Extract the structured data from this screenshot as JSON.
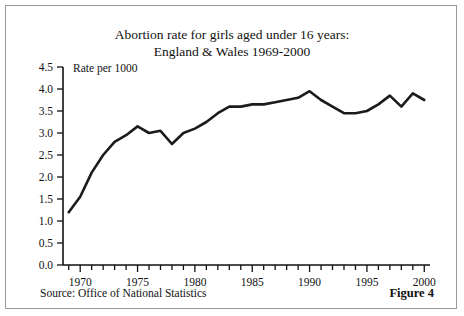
{
  "figure": {
    "source_note": "Source: Office of National Statistics",
    "figure_label": "Figure 4"
  },
  "chart_data": {
    "type": "line",
    "title": "Abortion rate for girls aged under 16 years:",
    "subtitle": "England & Wales 1969-2000",
    "title_line1": "Abortion rate for girls aged under 16 years:",
    "title_line2": "England & Wales 1969-2000",
    "xlabel": "",
    "ylabel": "",
    "axis_note": "Rate per 1000",
    "grid": false,
    "legend": "none",
    "xlim": [
      1968.5,
      2000.5
    ],
    "ylim": [
      0.0,
      4.5
    ],
    "yticks": [
      0.0,
      0.5,
      1.0,
      1.5,
      2.0,
      2.5,
      3.0,
      3.5,
      4.0,
      4.5
    ],
    "ytick_labels": [
      "0.0",
      "0.5",
      "1.0",
      "1.5",
      "2.0",
      "2.5",
      "3.0",
      "3.5",
      "4.0",
      "4.5"
    ],
    "xticks": [
      1969,
      1970,
      1971,
      1972,
      1973,
      1974,
      1975,
      1976,
      1977,
      1978,
      1979,
      1980,
      1981,
      1982,
      1983,
      1984,
      1985,
      1986,
      1987,
      1988,
      1989,
      1990,
      1991,
      1992,
      1993,
      1994,
      1995,
      1996,
      1997,
      1998,
      1999,
      2000
    ],
    "xtick_labels": [
      {
        "value": 1970,
        "label": "1970"
      },
      {
        "value": 1975,
        "label": "1975"
      },
      {
        "value": 1980,
        "label": "1980"
      },
      {
        "value": 1985,
        "label": "1985"
      },
      {
        "value": 1990,
        "label": "1990"
      },
      {
        "value": 1995,
        "label": "1995"
      },
      {
        "value": 2000,
        "label": "2000"
      }
    ],
    "x": [
      1969,
      1970,
      1971,
      1972,
      1973,
      1974,
      1975,
      1976,
      1977,
      1978,
      1979,
      1980,
      1981,
      1982,
      1983,
      1984,
      1985,
      1986,
      1987,
      1988,
      1989,
      1990,
      1991,
      1992,
      1993,
      1994,
      1995,
      1996,
      1997,
      1998,
      1999,
      2000
    ],
    "values": [
      1.2,
      1.55,
      2.1,
      2.5,
      2.8,
      2.95,
      3.15,
      3.0,
      3.05,
      2.75,
      3.0,
      3.1,
      3.25,
      3.45,
      3.6,
      3.6,
      3.65,
      3.65,
      3.7,
      3.75,
      3.8,
      3.95,
      3.75,
      3.6,
      3.45,
      3.45,
      3.5,
      3.65,
      3.85,
      3.6,
      3.9,
      3.75
    ],
    "series": [
      {
        "name": "Abortion rate per 1000 girls aged under 16",
        "values": [
          1.2,
          1.55,
          2.1,
          2.5,
          2.8,
          2.95,
          3.15,
          3.0,
          3.05,
          2.75,
          3.0,
          3.1,
          3.25,
          3.45,
          3.6,
          3.6,
          3.65,
          3.65,
          3.7,
          3.75,
          3.8,
          3.95,
          3.75,
          3.6,
          3.45,
          3.45,
          3.5,
          3.65,
          3.85,
          3.6,
          3.9,
          3.75
        ],
        "color": "#1b1b1b"
      }
    ]
  }
}
